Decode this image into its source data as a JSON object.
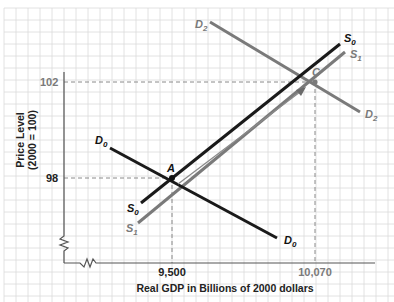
{
  "chart_data": {
    "type": "line",
    "title": "",
    "xlabel": "Real GDP in Billions of 2000 dollars",
    "ylabel_line1": "Price Level",
    "ylabel_line2": "(2000 = 100)",
    "x_ticks": [
      "9,500",
      "10,070"
    ],
    "y_ticks": [
      "98",
      "102"
    ],
    "points": [
      {
        "label": "A",
        "x": 9500,
        "y": 98
      },
      {
        "label": "C",
        "x": 10070,
        "y": 102
      }
    ],
    "series": [
      {
        "name": "D0",
        "sub": "0",
        "base": "D",
        "color": "#1a1a1a",
        "description": "Initial aggregate demand",
        "passes_through": "A"
      },
      {
        "name": "D2",
        "sub": "2",
        "base": "D",
        "color": "#7a7a7a",
        "description": "Shifted aggregate demand",
        "passes_through": "C"
      },
      {
        "name": "S0",
        "sub": "0",
        "base": "S",
        "color": "#1a1a1a",
        "description": "Initial aggregate supply",
        "passes_through": "A"
      },
      {
        "name": "S1",
        "sub": "1",
        "base": "S",
        "color": "#7a7a7a",
        "description": "Shifted aggregate supply",
        "passes_through": "C"
      }
    ],
    "annotations": [
      "Arrow from A to C along supply curves"
    ],
    "grid": true,
    "axis_breaks": true
  },
  "labels": {
    "y_tick_high": "102",
    "y_tick_low": "98",
    "x_tick_left": "9,500",
    "x_tick_right": "10,070",
    "point_a": "A",
    "point_c": "C",
    "xlabel": "Real GDP in Billions of 2000 dollars",
    "ylabel_line1": "Price Level",
    "ylabel_line2": "(2000 = 100)",
    "D": "D",
    "S": "S",
    "sub0": "0",
    "sub1": "1",
    "sub2": "2"
  },
  "colors": {
    "black_curve": "#1a1a1a",
    "gray_curve": "#7a7a7a",
    "grid": "#d9d9d9",
    "axis": "#555555",
    "dashed": "#888888"
  }
}
